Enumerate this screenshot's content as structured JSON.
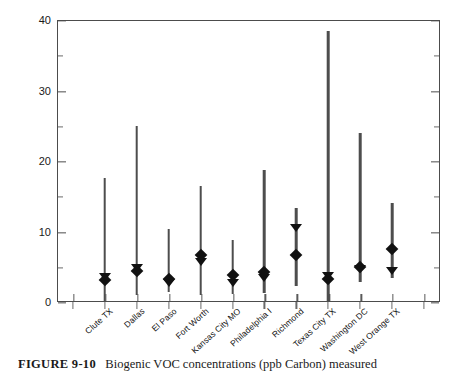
{
  "figure": {
    "caption_label": "FIGURE 9-10",
    "caption_text": "Biogenic VOC concentrations (ppb Carbon) measured"
  },
  "chart_data": {
    "type": "scatter",
    "title": "",
    "xlabel": "",
    "ylabel": "ppb Carbon",
    "ylim": [
      0,
      40
    ],
    "ytick_labels": [
      "0",
      "10",
      "20",
      "30",
      "40"
    ],
    "ytick_values": [
      0,
      10,
      20,
      30,
      40
    ],
    "yminor_values": [
      5,
      15,
      25,
      35
    ],
    "grid": false,
    "legend_position": "none",
    "categories": [
      "Clute TX",
      "Dallas",
      "El Paso",
      "Fort Worth",
      "Kansas City MO",
      "Philadelphia I",
      "Richmond",
      "Texas City TX",
      "Washington DC",
      "West Orange TX"
    ],
    "series": [
      {
        "name": "range-min",
        "values": [
          0.0,
          1.0,
          1.4,
          1.0,
          1.2,
          1.3,
          2.2,
          0.0,
          2.9,
          3.4
        ]
      },
      {
        "name": "range-max",
        "values": [
          17.6,
          24.9,
          10.4,
          16.5,
          8.8,
          18.7,
          13.3,
          38.4,
          24.0,
          14.0
        ]
      },
      {
        "name": "mean-diamond",
        "values": [
          3.1,
          4.4,
          3.2,
          6.7,
          3.8,
          4.3,
          6.7,
          3.2,
          5.0,
          7.5
        ]
      },
      {
        "name": "median-triangle",
        "values": [
          3.1,
          4.4,
          2.2,
          5.3,
          2.2,
          3.0,
          10.1,
          3.2,
          4.2,
          4.0
        ]
      }
    ]
  }
}
